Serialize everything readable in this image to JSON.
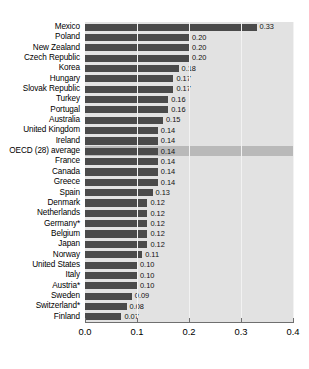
{
  "chart_data": {
    "type": "bar",
    "orientation": "horizontal",
    "title": "",
    "subtitle": "",
    "xlabel": "",
    "ylabel": "",
    "xlim": [
      0.0,
      0.4
    ],
    "xticks": [
      0.0,
      0.1,
      0.2,
      0.3,
      0.4
    ],
    "xtick_labels": [
      "0.0",
      "0.1",
      "0.2",
      "0.3",
      "0.4"
    ],
    "grid": true,
    "grid_axis": "x",
    "legend": false,
    "legend_position": "none",
    "value_label_format": "0.00",
    "highlight_category": "OECD (28) average",
    "bar_color": "#4a4a4a",
    "row_band_color": "#e2e2e2",
    "highlight_band_color": "#b9b9b9",
    "categories": [
      "Mexico",
      "Poland",
      "New Zealand",
      "Czech Republic",
      "Korea",
      "Hungary",
      "Slovak Republic",
      "Turkey",
      "Portugal",
      "Australia",
      "United Kingdom",
      "Ireland",
      "OECD (28) average",
      "France",
      "Canada",
      "Greece",
      "Spain",
      "Denmark",
      "Netherlands",
      "Germany*",
      "Belgium",
      "Japan",
      "Norway",
      "United States",
      "Italy",
      "Austria*",
      "Sweden",
      "Switzerland*",
      "Finland"
    ],
    "values": [
      0.33,
      0.2,
      0.2,
      0.2,
      0.18,
      0.17,
      0.17,
      0.16,
      0.16,
      0.15,
      0.14,
      0.14,
      0.14,
      0.14,
      0.14,
      0.14,
      0.13,
      0.12,
      0.12,
      0.12,
      0.12,
      0.12,
      0.11,
      0.1,
      0.1,
      0.1,
      0.09,
      0.08,
      0.07
    ],
    "value_labels": [
      "0.33",
      "0.20",
      "0.20",
      "0.20",
      "0.18",
      "0.17",
      "0.17",
      "0.16",
      "0.16",
      "0.15",
      "0.14",
      "0.14",
      "0.14",
      "0.14",
      "0.14",
      "0.14",
      "0.13",
      "0.12",
      "0.12",
      "0.12",
      "0.12",
      "0.12",
      "0.11",
      "0.10",
      "0.10",
      "0.10",
      "0.09",
      "0.08",
      "0.07"
    ]
  }
}
